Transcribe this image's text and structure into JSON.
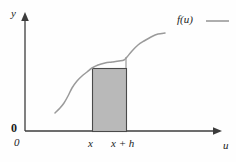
{
  "figure": {
    "type": "math-diagram",
    "background_color": "#fefefe",
    "curve_color": "#9a9a9a",
    "axis_color": "#3c3c3c",
    "rect_fill_color": "#b9b9b9",
    "rect_stroke_color": "#4a4a4a"
  },
  "axes": {
    "y_axis_label": "y",
    "x_axis_label": "u",
    "origin_label_y": "0",
    "origin_label_x": "0"
  },
  "ticks": {
    "x_ticks": [
      {
        "label": "x",
        "value": "x"
      },
      {
        "label": "x + h",
        "value": "x+h"
      }
    ]
  },
  "legend": {
    "entries": [
      {
        "label": "f(u)",
        "swatch": "line-segment",
        "color": "#9a9a9a"
      }
    ]
  },
  "chart_data": {
    "type": "line",
    "title": "",
    "xlabel": "u",
    "ylabel": "y",
    "grid": false,
    "legend_position": "top-right",
    "series": [
      {
        "name": "f(u)",
        "color": "#9a9a9a",
        "points": [
          [
            55,
            113
          ],
          [
            60,
            108
          ],
          [
            64,
            103
          ],
          [
            68,
            96
          ],
          [
            72,
            88
          ],
          [
            77,
            81
          ],
          [
            82,
            76
          ],
          [
            87,
            72
          ],
          [
            92,
            68
          ],
          [
            98,
            65
          ],
          [
            105,
            63
          ],
          [
            112,
            62
          ],
          [
            119,
            61
          ],
          [
            124,
            60
          ],
          [
            127,
            57
          ],
          [
            132,
            51
          ],
          [
            138,
            45
          ],
          [
            144,
            41
          ],
          [
            151,
            37
          ],
          [
            158,
            34
          ],
          [
            165,
            33
          ]
        ]
      }
    ],
    "shaded_region": {
      "name": "rectangle",
      "x_left": 92,
      "x_right": 126,
      "y_top": 68,
      "y_bottom": 131,
      "fill": "#b9b9b9",
      "stroke": "#4a4a4a",
      "meaning": "area f(x) * h"
    },
    "annotations": [
      {
        "name": "increment-tick",
        "type": "vertical-segment",
        "x": 126,
        "y_top": 57,
        "y_bottom": 68,
        "color": "#8f8f8f"
      }
    ],
    "axis_geometry": {
      "y_axis_x": 25,
      "y_axis_top": 14,
      "x_axis_y": 131,
      "x_axis_right": 222
    }
  }
}
